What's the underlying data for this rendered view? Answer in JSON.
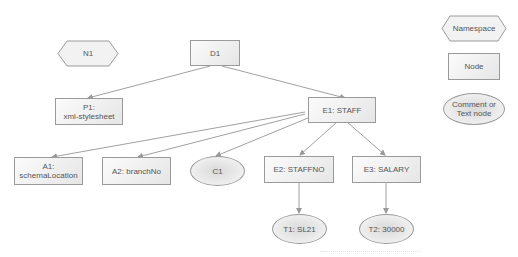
{
  "nodes": {
    "n1": {
      "label": "N1",
      "type": "namespace"
    },
    "d1": {
      "label": "D1",
      "type": "node"
    },
    "p1": {
      "label": "P1:\nxml-stylesheet",
      "line1": "P1:",
      "line2": "xml-stylesheet",
      "type": "node"
    },
    "e1": {
      "label": "E1: STAFF",
      "type": "node"
    },
    "a1": {
      "label": "A1:\nschemaLocation",
      "line1": "A1:",
      "line2": "schemaLocation",
      "type": "node"
    },
    "a2": {
      "label": "A2: branchNo",
      "type": "node"
    },
    "c1": {
      "label": "C1",
      "type": "comment"
    },
    "e2": {
      "label": "E2: STAFFNO",
      "type": "node"
    },
    "e3": {
      "label": "E3: SALARY",
      "type": "node"
    },
    "t1": {
      "label": "T1: SL21",
      "type": "text"
    },
    "t2": {
      "label": "T2: 30000",
      "type": "text"
    }
  },
  "edges": [
    [
      "D1",
      "P1"
    ],
    [
      "D1",
      "E1"
    ],
    [
      "E1",
      "A1"
    ],
    [
      "E1",
      "A2"
    ],
    [
      "E1",
      "C1"
    ],
    [
      "E1",
      "E2"
    ],
    [
      "E1",
      "E3"
    ],
    [
      "E2",
      "T1"
    ],
    [
      "E3",
      "T2"
    ]
  ],
  "legend": {
    "namespace": "Namespace",
    "node": "Node",
    "comment_line1": "Comment or",
    "comment_line2": "Text node"
  },
  "colors": {
    "edge": "#999999",
    "border": "#9a9a9a",
    "text": "#555555"
  }
}
